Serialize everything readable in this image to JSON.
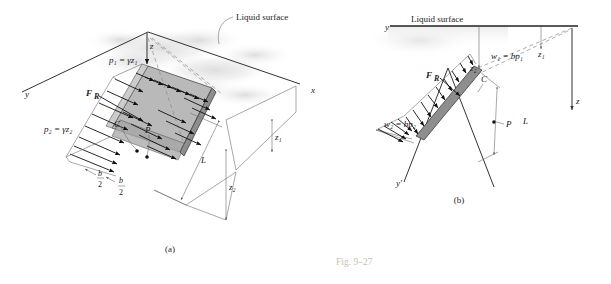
{
  "figure": {
    "caption": "Fig. 9–27",
    "subfigure_a_label": "(a)",
    "subfigure_b_label": "(b)"
  },
  "panel_a": {
    "name": "3d-pictorial-inclined-plate",
    "liquid_surface_label": "Liquid surface",
    "axes": {
      "y": "y",
      "x": "x",
      "z": "z"
    },
    "pressure_top_label": "p₁ = γz₁",
    "pressure_bottom_label": "p₂ = γz₂",
    "resultant_force_label": "F",
    "resultant_force_sub": "R",
    "centroid_label": "C",
    "pressure_center_label": "P",
    "length_label": "L",
    "depth_top_label": "z₁",
    "depth_bottom_label": "z₂",
    "half_width_numerator": "b",
    "half_width_denominator": "2",
    "half_width_label_1": "b/2",
    "half_width_label_2": "b/2"
  },
  "panel_b": {
    "name": "2d-edge-view-inclined-plate",
    "liquid_surface_label": "Liquid surface",
    "axes": {
      "y": "y",
      "y_prime": "y′",
      "z": "z"
    },
    "load_top_label": "w₁ = bp₁",
    "load_bottom_label": "w₂ = bp₂",
    "resultant_force_label": "F",
    "resultant_force_sub": "R",
    "centroid_label": "C",
    "pressure_center_label": "P",
    "length_label": "L",
    "depth_top_label": "z₁",
    "depth_bottom_label": "z₂"
  },
  "colors": {
    "plate_fill": "#b9b9b9",
    "plate_edge": "#8e8e8e",
    "line": "#3a3a3a",
    "caption": "#c9bfae",
    "background": "#ffffff"
  }
}
